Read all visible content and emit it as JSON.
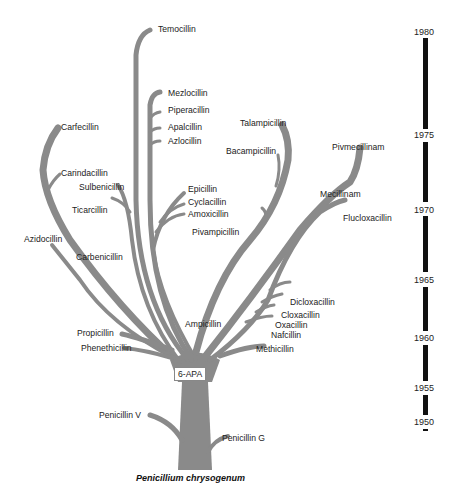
{
  "diagram": {
    "root": "Penicillium chrysogenum",
    "hub": "6-APA",
    "branch_color": "#8a8a8a",
    "labels": {
      "temocillin": "Temocillin",
      "mezlocillin": "Mezlocillin",
      "piperacillin": "Piperacillin",
      "apalcillin": "Apalcillin",
      "azlocillin": "Azlocillin",
      "carfecillin": "Carfecillin",
      "talampicillin": "Talampicillin",
      "bacampicillin": "Bacampicillin",
      "pivmecillinam": "Pivmecillinam",
      "carindacillin": "Carindacillin",
      "sulbenicillin": "Sulbenicillin",
      "epicillin": "Epicillin",
      "cyclacillin": "Cyclacillin",
      "amoxicillin": "Amoxicillin",
      "mecillinam": "Mecillinam",
      "ticarcillin": "Ticarcillin",
      "flucloxacillin": "Flucloxacillin",
      "pivampicillin": "Pivampicillin",
      "azidocillin": "Azidocillin",
      "carbenicillin": "Carbenicillin",
      "dicloxacillin": "Dicloxacillin",
      "cloxacillin": "Cloxacillin",
      "oxacillin": "Oxacillin",
      "nafcillin": "Nafcillin",
      "ampicillin": "Ampicillin",
      "methicillin": "Methicillin",
      "propicillin": "Propicillin",
      "phenethicillin": "Phenethicillin",
      "penicillin_v": "Penicillin V",
      "penicillin_g": "Penicillin G"
    }
  },
  "timeline": {
    "bar_color": "#111111",
    "years": [
      "1980",
      "1975",
      "1970",
      "1965",
      "1960",
      "1955",
      "1950"
    ]
  }
}
